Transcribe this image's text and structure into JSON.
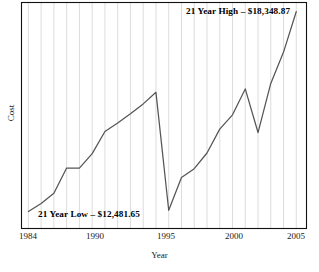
{
  "chart_data": {
    "type": "line",
    "title": "",
    "xlabel": "Year",
    "ylabel": "Cost",
    "xlim": [
      1983.5,
      2005.8
    ],
    "ylim": [
      12000,
      18600
    ],
    "grid": "vertical",
    "legend": "none",
    "line_color": "#555555",
    "x_ticks": [
      "1984",
      "1990",
      "1995",
      "2000",
      "2005"
    ],
    "x_tick_values": [
      1984,
      1990,
      1995,
      2000,
      2005
    ],
    "y_ticks": [],
    "series": [
      {
        "name": "Cost",
        "x": [
          1984,
          1985,
          1986,
          1987,
          1988,
          1989,
          1990,
          1991,
          1992,
          1993,
          1994,
          1995,
          1996,
          1997,
          1998,
          1999,
          2000,
          2001,
          2002,
          2003,
          2004,
          2005
        ],
        "values": [
          12481.65,
          12720,
          13020,
          13760,
          13755,
          14180,
          14830,
          15080,
          15350,
          15640,
          15980,
          12520,
          13480,
          13740,
          14200,
          14900,
          15320,
          16080,
          14800,
          16240,
          17160,
          18348.87
        ]
      }
    ],
    "annotations": [
      {
        "name": "high-annotation",
        "text": "21 Year High – $18,348.87",
        "value": 18348.87,
        "year": 2005
      },
      {
        "name": "low-annotation",
        "text": "21 Year Low – $12,481.65",
        "value": 12481.65,
        "year": 1995
      }
    ]
  },
  "axes": {
    "y_title": "Cost",
    "x_title": "Year"
  },
  "ticks": {
    "x": [
      {
        "label": "1984",
        "x": 28
      },
      {
        "label": "1990",
        "x": 95
      },
      {
        "label": "1995",
        "x": 166
      },
      {
        "label": "2000",
        "x": 234
      },
      {
        "label": "2005",
        "x": 296
      }
    ]
  },
  "annotations": {
    "high": "21 Year High – $18,348.87",
    "low": "21 Year Low – $12,481.65"
  },
  "colors": {
    "line": "#555555",
    "frame": "#111111",
    "grid": "#d8d8d8",
    "text": "#1a1a1a"
  }
}
